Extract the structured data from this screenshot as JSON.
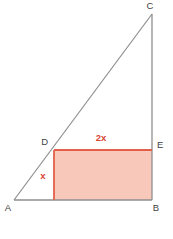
{
  "diagram": {
    "vertex_labels": {
      "a": "A",
      "b": "B",
      "c": "C",
      "d": "D",
      "e": "E"
    },
    "measurements": {
      "rect_width_label": "2x",
      "rect_height_label": "x"
    },
    "colors": {
      "triangle_line": "#8e8e8e",
      "vertex_text": "#3f3f3f",
      "rect_fill": "#f8c9bb",
      "rect_edge_red": "#e2604a",
      "measure_text": "#d94332",
      "background": "#ffffff"
    }
  }
}
